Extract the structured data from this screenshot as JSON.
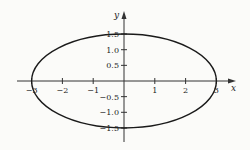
{
  "chart_data": {
    "type": "line",
    "title": "",
    "xlabel": "x",
    "ylabel": "y",
    "xlim": [
      -3.5,
      3.6
    ],
    "ylim": [
      -1.9,
      2.2
    ],
    "grid": false,
    "legend": null,
    "x_ticks": [
      -3,
      -2,
      -1,
      1,
      2,
      3
    ],
    "x_tick_labels": [
      "−3",
      "−2",
      "−1",
      "1",
      "2",
      "3"
    ],
    "y_ticks": [
      1.5,
      1.0,
      0.5,
      -0.5,
      -1.0,
      -1.5
    ],
    "y_tick_labels": [
      "1.5",
      "1.0",
      "0.5",
      "−0.5",
      "−1.0",
      "−1.5"
    ],
    "series": [
      {
        "name": "ellipse",
        "shape": "ellipse",
        "center": [
          0,
          0
        ],
        "semi_major_x": 3,
        "semi_minor_y": 1.5,
        "color": "#1a1a1a"
      }
    ]
  },
  "colors": {
    "curve": "#1a1a1a",
    "axis": "#333333",
    "background": "#fbfbf9"
  }
}
